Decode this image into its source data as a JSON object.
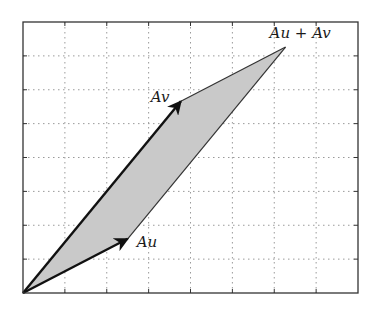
{
  "diagram": {
    "type": "parallelogram-linear-transform",
    "frame": {
      "left": 23,
      "top": 22,
      "right": 358,
      "bottom": 293
    },
    "grid": {
      "columns": 8,
      "rows": 8,
      "style": "dotted",
      "color": "#9a9a9a"
    },
    "origin": [
      0,
      0
    ],
    "vectors": {
      "Au": {
        "label": "Au",
        "tip": [
          2.5,
          1.6
        ]
      },
      "Av": {
        "label": "Av",
        "tip": [
          3.77,
          5.66
        ]
      },
      "sum": {
        "label": "Au + Av",
        "tip": [
          6.27,
          7.26
        ]
      }
    },
    "colors": {
      "fill": "#c9c9c9",
      "vector": "#111111",
      "edge": "#333333",
      "frame": "#333333"
    }
  },
  "labels": {
    "au": "Au",
    "av": "Av",
    "sum": "Au + Av"
  }
}
